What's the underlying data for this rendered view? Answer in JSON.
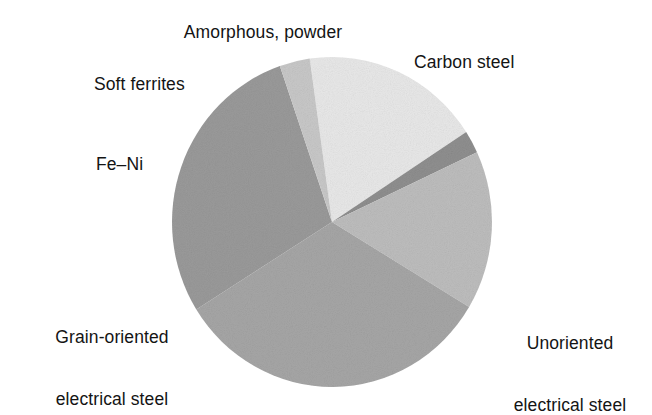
{
  "figure": {
    "background_color": "#ffffff",
    "text_color": "#141414"
  },
  "chart_data": {
    "type": "pie",
    "title": "",
    "subtitle": "",
    "xlabel": "",
    "ylabel": "",
    "grid": false,
    "legend_position": "outside-labels",
    "start_angle_deg": 352,
    "direction": "clockwise",
    "center": {
      "x": 332,
      "y": 222
    },
    "radius": {
      "rx": 160,
      "ry": 165
    },
    "labels": [
      "Amorphous, powder",
      "Carbon steel",
      "Unoriented electrical steel",
      "Grain-oriented electrical steel",
      "Fe–Ni",
      "Soft ferrites"
    ],
    "values": [
      2.2,
      15.6,
      32.5,
      28.6,
      3.1,
      18.0
    ],
    "angles_deg": [
      8,
      56,
      117,
      103,
      11,
      65
    ],
    "colors": [
      "#8f8f8f",
      "#bdbdbd",
      "#a6a6a6",
      "#9a9a9a",
      "#c8c8c8",
      "#e8e8e8"
    ],
    "slices": [
      {
        "label": "Amorphous, powder",
        "value": 2.2,
        "angle_deg": 8,
        "color": "#8f8f8f"
      },
      {
        "label": "Carbon steel",
        "value": 15.6,
        "angle_deg": 56,
        "color": "#bdbdbd"
      },
      {
        "label": "Unoriented electrical steel",
        "value": 32.5,
        "angle_deg": 117,
        "color": "#a6a6a6"
      },
      {
        "label": "Grain-oriented electrical steel",
        "value": 28.6,
        "angle_deg": 103,
        "color": "#9a9a9a"
      },
      {
        "label": "Fe–Ni",
        "value": 3.1,
        "angle_deg": 11,
        "color": "#c8c8c8"
      },
      {
        "label": "Soft ferrites",
        "value": 18.0,
        "angle_deg": 65,
        "color": "#e8e8e8"
      }
    ]
  },
  "callouts": {
    "amorphous": "Amorphous, powder",
    "carbon_steel": "Carbon steel",
    "soft_ferrites": "Soft ferrites",
    "fe_ni": "Fe–Ni",
    "grain_oriented_line1": "Grain-oriented",
    "grain_oriented_line2": "electrical steel",
    "unoriented_line1": "Unoriented",
    "unoriented_line2": "electrical steel"
  }
}
